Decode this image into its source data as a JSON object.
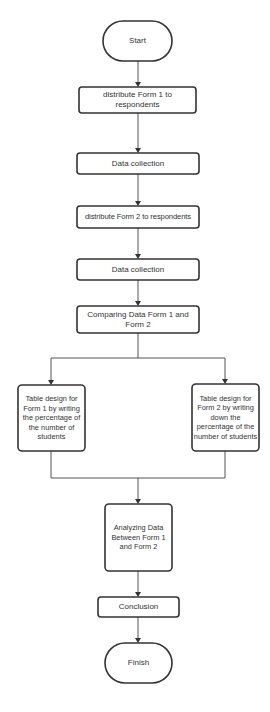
{
  "diagram": {
    "type": "flowchart",
    "colors": {
      "background": "#ffffff",
      "stroke": "#333333",
      "edge": "#555555",
      "text": "#333333"
    },
    "nodes": [
      {
        "id": "start",
        "shape": "terminator",
        "label": "Start"
      },
      {
        "id": "distribute1",
        "shape": "process",
        "label": "distribute Form 1 to respondents"
      },
      {
        "id": "collect1",
        "shape": "process",
        "label": "Data collection"
      },
      {
        "id": "distribute2",
        "shape": "process",
        "label": "distribute Form 2 to respondents"
      },
      {
        "id": "collect2",
        "shape": "process",
        "label": "Data collection"
      },
      {
        "id": "compare",
        "shape": "process",
        "label": "Comparing Data Form 1 and Form 2"
      },
      {
        "id": "table1",
        "shape": "process",
        "label": "Table design for Form 1 by writing the percentage of the number of students"
      },
      {
        "id": "table2",
        "shape": "process",
        "label": "Table design for Form 2 by writing down the percentage of the number of students"
      },
      {
        "id": "analyze",
        "shape": "process",
        "label": "Analyzing Data Between Form 1 and Form 2"
      },
      {
        "id": "conclusion",
        "shape": "process",
        "label": "Conclusion"
      },
      {
        "id": "finish",
        "shape": "terminator",
        "label": "Finish"
      }
    ],
    "edges": [
      {
        "from": "start",
        "to": "distribute1"
      },
      {
        "from": "distribute1",
        "to": "collect1"
      },
      {
        "from": "collect1",
        "to": "distribute2"
      },
      {
        "from": "distribute2",
        "to": "collect2"
      },
      {
        "from": "collect2",
        "to": "compare"
      },
      {
        "from": "compare",
        "to": "table1"
      },
      {
        "from": "compare",
        "to": "table2"
      },
      {
        "from": "table1",
        "to": "analyze"
      },
      {
        "from": "table2",
        "to": "analyze"
      },
      {
        "from": "analyze",
        "to": "conclusion"
      },
      {
        "from": "conclusion",
        "to": "finish"
      }
    ]
  }
}
